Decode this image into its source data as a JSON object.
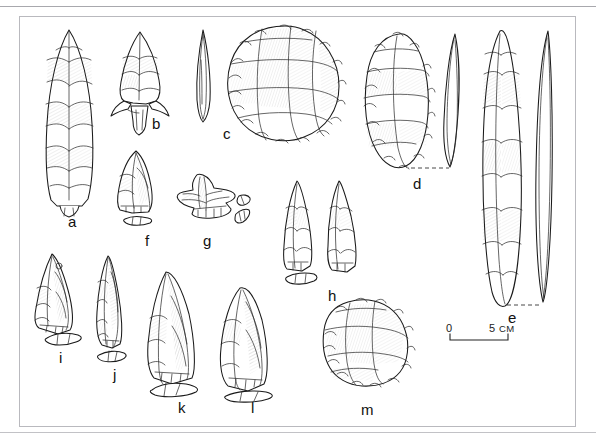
{
  "figure": {
    "kind": "archaeological-lithic-plate",
    "background_color": "#ffffff",
    "ink_color": "#1a1a1a",
    "frame_color": "#b9b9be",
    "rule_color": "#a8a8ad",
    "frame": {
      "x": 19,
      "y": 16,
      "width": 557,
      "height": 411
    }
  },
  "scale_bar": {
    "zero_label": "0",
    "max_label": "5",
    "unit_label": "CM",
    "start_x": 450,
    "end_x": 508,
    "baseline_y": 340
  },
  "specimens": [
    {
      "id": "a",
      "label": "a",
      "description": "large bifacially flaked lanceolate point, face view",
      "label_x": 68,
      "label_y": 214,
      "views": [
        "face"
      ]
    },
    {
      "id": "b",
      "label": "b",
      "description": "stemmed and barbed projectile point, face view",
      "label_x": 152,
      "label_y": 116,
      "views": [
        "face"
      ]
    },
    {
      "id": "c",
      "label": "c",
      "description": "thin leaf-shaped biface profile paired with large discoidal biface face view",
      "label_x": 223,
      "label_y": 126,
      "views": [
        "profile",
        "face"
      ]
    },
    {
      "id": "d",
      "label": "d",
      "description": "oval bifacially flaked tool, face view with edge profile joined by dashed line",
      "label_x": 413,
      "label_y": 176,
      "views": [
        "face",
        "profile"
      ]
    },
    {
      "id": "e",
      "label": "e",
      "description": "long slender bifacial blade, face view with edge profile joined by dashed line",
      "label_x": 508,
      "label_y": 310,
      "views": [
        "face",
        "profile"
      ]
    },
    {
      "id": "f",
      "label": "f",
      "description": "retouched flake tool with cross-section below",
      "label_x": 145,
      "label_y": 233,
      "views": [
        "face",
        "cross-section"
      ]
    },
    {
      "id": "g",
      "label": "g",
      "description": "notched / spurred flake tool with detached cross-section",
      "label_x": 203,
      "label_y": 233,
      "views": [
        "face",
        "cross-section"
      ]
    },
    {
      "id": "h",
      "label": "h",
      "description": "pair of triangular points with cross-section",
      "label_x": 328,
      "label_y": 288,
      "views": [
        "face",
        "face",
        "cross-section"
      ]
    },
    {
      "id": "i",
      "label": "i",
      "description": "triangular retouched flake point with cross-section",
      "label_x": 59,
      "label_y": 350,
      "views": [
        "face",
        "cross-section"
      ]
    },
    {
      "id": "j",
      "label": "j",
      "description": "narrow elongated flake tool with cross-section",
      "label_x": 113,
      "label_y": 367,
      "views": [
        "face",
        "cross-section"
      ]
    },
    {
      "id": "k",
      "label": "k",
      "description": "large elongated flake blade with cross-section",
      "label_x": 178,
      "label_y": 400,
      "views": [
        "face",
        "cross-section"
      ]
    },
    {
      "id": "l",
      "label": "l",
      "description": "broad flake blade with cross-section",
      "label_x": 251,
      "label_y": 400,
      "views": [
        "face",
        "cross-section"
      ]
    },
    {
      "id": "m",
      "label": "m",
      "description": "discoidal core / chunky flaked nodule",
      "label_x": 361,
      "label_y": 402,
      "views": [
        "face"
      ]
    }
  ]
}
